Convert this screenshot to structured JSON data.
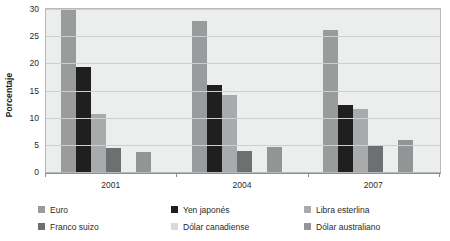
{
  "chart_data": {
    "type": "bar",
    "title": "",
    "subtitle": "",
    "xlabel": "",
    "ylabel": "Porcentaje",
    "categories": [
      "2001",
      "2004",
      "2007"
    ],
    "ylim": [
      0,
      30
    ],
    "yticks": [
      0,
      5,
      10,
      15,
      20,
      25,
      30
    ],
    "ytick_labels": [
      "0",
      "5",
      "10",
      "15",
      "20",
      "25",
      "30"
    ],
    "grid": true,
    "legend_position": "bottom",
    "series": [
      {
        "name": "Euro",
        "color": "#9a9b9c",
        "values": [
          30.0,
          27.8,
          26.2
        ]
      },
      {
        "name": "Yen japonés",
        "color": "#1f1f1f",
        "values": [
          19.3,
          16.0,
          12.3
        ]
      },
      {
        "name": "Libra esterlina",
        "color": "#a9aaab",
        "values": [
          10.7,
          14.2,
          11.6
        ]
      },
      {
        "name": "Franco suizo",
        "color": "#6e6f70",
        "values": [
          4.5,
          3.8,
          4.7
        ]
      },
      {
        "name": "Dólar canadiense",
        "color": "#d9dada",
        "values": [
          0.0,
          0.0,
          0.0
        ]
      },
      {
        "name": "Dólar australiano",
        "color": "#939495",
        "values": [
          3.6,
          4.6,
          5.9
        ]
      }
    ]
  },
  "legend": {
    "items": [
      {
        "label": "Euro",
        "color": "#9a9b9c"
      },
      {
        "label": "Franco suizo",
        "color": "#6e6f70"
      },
      {
        "label": "Yen japonés",
        "color": "#1f1f1f"
      },
      {
        "label": "Dólar canadiense",
        "color": "#d9dada"
      },
      {
        "label": "Libra esterlina",
        "color": "#a9aaab"
      },
      {
        "label": "Dólar australiano",
        "color": "#939495"
      }
    ]
  }
}
